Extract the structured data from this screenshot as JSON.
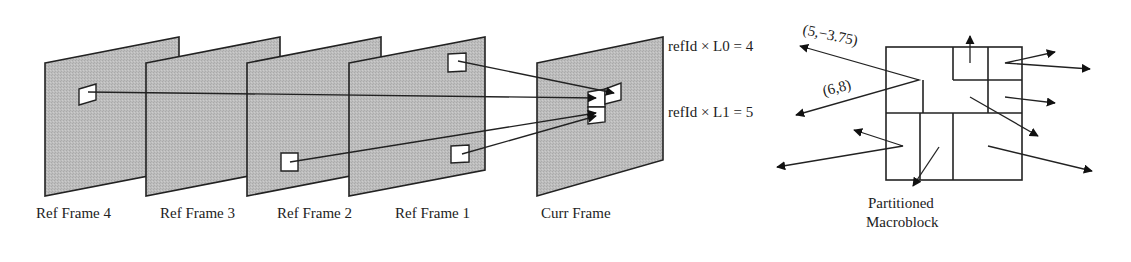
{
  "diagram": {
    "type": "multi-reference motion compensation illustration",
    "frames": [
      {
        "label": "Ref Frame 4"
      },
      {
        "label": "Ref Frame 3"
      },
      {
        "label": "Ref Frame 2"
      },
      {
        "label": "Ref Frame 1"
      },
      {
        "label": "Curr Frame"
      }
    ],
    "ref_labels": {
      "l0": "refId × L0 = 4",
      "l1": "refId × L1 = 5"
    },
    "motion_vectors": {
      "mv0": "(5,−3.75)",
      "mv1": "(6,8)"
    },
    "macroblock": {
      "label_line1": "Partitioned",
      "label_line2": "Macroblock"
    },
    "colors": {
      "frame_fill": "#b9b9b9",
      "stroke": "#222222",
      "block_fill": "#ffffff"
    }
  }
}
